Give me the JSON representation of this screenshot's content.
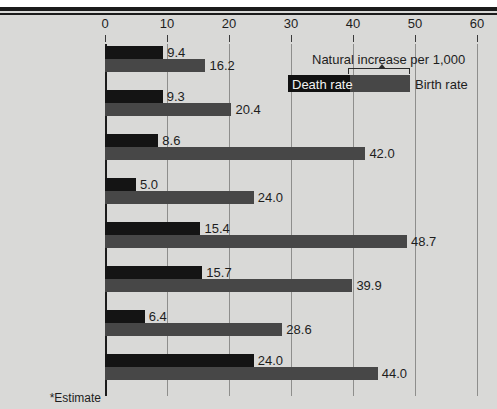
{
  "chart_data": {
    "type": "bar",
    "orientation": "horizontal",
    "title": "",
    "xlabel": "",
    "ylabel": "",
    "xlim": [
      0,
      60
    ],
    "xticks": [
      0,
      10,
      20,
      30,
      40,
      50,
      60
    ],
    "grid": true,
    "legend_position": "top-right",
    "categories": [
      "United States",
      "Uruguay",
      "Mexico",
      "China (Taiwan)*",
      "Algeria",
      "India",
      "Sri Lanka",
      "Chad"
    ],
    "series": [
      {
        "name": "Death rate",
        "color": "#141414",
        "values": [
          9.4,
          9.3,
          8.6,
          5.0,
          15.4,
          15.7,
          6.4,
          24.0
        ]
      },
      {
        "name": "Birth rate",
        "color": "#474747",
        "values": [
          16.2,
          20.4,
          42.0,
          24.0,
          48.7,
          39.9,
          28.6,
          44.0
        ]
      }
    ],
    "annotations": [
      "Natural increase per 1,000",
      "*Estimate"
    ]
  },
  "axis": {
    "ticks": [
      "0",
      "10",
      "20",
      "30",
      "40",
      "50",
      "60"
    ]
  },
  "rows": [
    {
      "country": "United States",
      "death": "9.4",
      "birth": "16.2"
    },
    {
      "country": "Uruguay",
      "death": "9.3",
      "birth": "20.4"
    },
    {
      "country": "Mexico",
      "death": "8.6",
      "birth": "42.0"
    },
    {
      "country": "China (Taiwan)*",
      "death": "5.0",
      "birth": "24.0"
    },
    {
      "country": "Algeria",
      "death": "15.4",
      "birth": "48.7"
    },
    {
      "country": "India",
      "death": "15.7",
      "birth": "39.9"
    },
    {
      "country": "Sri Lanka",
      "death": "6.4",
      "birth": "28.6"
    },
    {
      "country": "Chad",
      "death": "24.0",
      "birth": "44.0"
    }
  ],
  "legend": {
    "title": "Natural increase per 1,000",
    "death_label": "Death rate",
    "birth_label": "Birth rate"
  },
  "footnote": "*Estimate",
  "colors": {
    "background": "#d9d9d7",
    "death_bar": "#141414",
    "birth_bar": "#474747",
    "gridline": "#8e8e8c",
    "axis": "#1b1b1b"
  }
}
